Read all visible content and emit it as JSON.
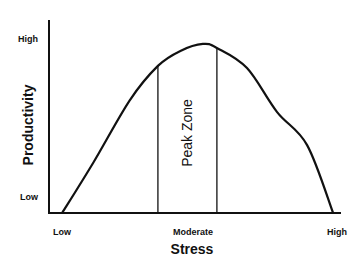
{
  "chart_data": {
    "type": "line",
    "title": "",
    "xlabel": "Stress",
    "ylabel": "Productivity",
    "xlim": [
      0,
      1
    ],
    "ylim": [
      0,
      1
    ],
    "grid": false,
    "x_ticks": [
      {
        "value": 0.05,
        "label": "Low"
      },
      {
        "value": 0.5,
        "label": "Moderate"
      },
      {
        "value": 0.97,
        "label": "High"
      }
    ],
    "y_ticks": [
      {
        "value": 0.1,
        "label": "Low"
      },
      {
        "value": 0.9,
        "label": "High"
      }
    ],
    "series": [
      {
        "name": "Productivity curve",
        "x": [
          0.045,
          0.151,
          0.277,
          0.373,
          0.45,
          0.527,
          0.575,
          0.678,
          0.781,
          0.884,
          0.973
        ],
        "y": [
          0.0,
          0.259,
          0.585,
          0.762,
          0.84,
          0.876,
          0.855,
          0.751,
          0.523,
          0.352,
          0.0
        ]
      }
    ],
    "annotations": [
      {
        "type": "vline",
        "x": 0.373,
        "label": ""
      },
      {
        "type": "vline",
        "x": 0.575,
        "label": ""
      },
      {
        "type": "region-label",
        "x": 0.474,
        "y": 0.45,
        "text": "Peak Zone",
        "rotation": "vertical"
      }
    ]
  }
}
